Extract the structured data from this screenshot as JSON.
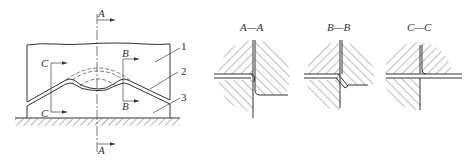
{
  "figure": {
    "main_view": {
      "section_markers": {
        "A_top": "A",
        "A_bottom": "A",
        "B_top": "B",
        "B_bottom": "B",
        "C_top": "C",
        "C_bottom": "C"
      },
      "part_labels": [
        "1",
        "2",
        "3"
      ]
    },
    "sections": [
      {
        "id": "A-A",
        "title": "A—A"
      },
      {
        "id": "B-B",
        "title": "B—B"
      },
      {
        "id": "C-C",
        "title": "C—C"
      }
    ]
  }
}
